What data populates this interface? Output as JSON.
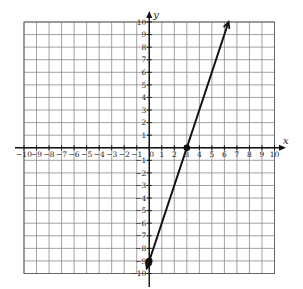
{
  "chart_data": {
    "type": "line",
    "title": "",
    "xlabel": "x",
    "ylabel": "y",
    "xlim": [
      -10,
      10
    ],
    "ylim": [
      -10,
      10
    ],
    "grid": true,
    "x_ticks": [
      -10,
      -9,
      -8,
      -7,
      -6,
      -5,
      -4,
      -3,
      -2,
      -1,
      0,
      1,
      2,
      3,
      4,
      5,
      6,
      7,
      8,
      9,
      10
    ],
    "y_ticks": [
      -10,
      -9,
      -8,
      -7,
      -6,
      -5,
      -4,
      -3,
      -2,
      -1,
      1,
      2,
      3,
      4,
      5,
      6,
      7,
      8,
      9,
      10
    ],
    "series": [
      {
        "name": "line",
        "equation": "y = 3x - 9",
        "slope": 3,
        "intercept": -9,
        "x": [
          -0.2,
          6.33
        ],
        "y": [
          -9.6,
          10
        ],
        "arrows": "both",
        "color": "#111111"
      }
    ],
    "points": [
      {
        "x": 0,
        "y": -9,
        "label": "y-intercept"
      },
      {
        "x": 3,
        "y": 0,
        "label": "x-intercept"
      }
    ]
  },
  "labels": {
    "x_axis": "x",
    "y_axis": "y",
    "origin": "0"
  },
  "colors": {
    "grid": "#8a8a8a",
    "axis": "#111111",
    "line": "#111111"
  }
}
